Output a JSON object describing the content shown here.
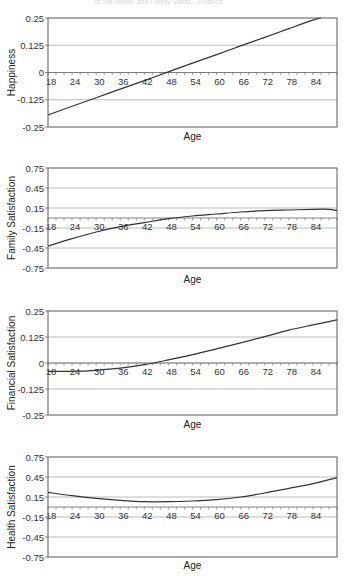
{
  "page": {
    "background": "#ffffff",
    "line_color": "#333333",
    "grid_color": "#aaaaaa",
    "border_color": "#666666",
    "bleed_through_text": "to the Health and Family Satisf... Finance"
  },
  "chart_data": [
    {
      "type": "line",
      "title": "",
      "xlabel": "Age",
      "ylabel": "Happiness",
      "xlim": [
        18,
        90
      ],
      "ylim": [
        -0.25,
        0.25
      ],
      "yticks": [
        0.25,
        0.125,
        0,
        -0.125,
        -0.25
      ],
      "ytick_labels": [
        "0.25",
        "0.125",
        "0",
        "-0.125",
        "-0.25"
      ],
      "xtick_labels": [
        "18",
        "24",
        "30",
        "36",
        "42",
        "48",
        "54",
        "60",
        "66",
        "72",
        "78",
        "84"
      ],
      "grid": true,
      "legend": null,
      "x": [
        18,
        24,
        30,
        36,
        42,
        48,
        54,
        60,
        66,
        72,
        78,
        84,
        86
      ],
      "values": [
        -0.195,
        -0.155,
        -0.116,
        -0.076,
        -0.037,
        0.003,
        0.043,
        0.082,
        0.122,
        0.161,
        0.201,
        0.24,
        0.25
      ]
    },
    {
      "type": "line",
      "title": "",
      "xlabel": "Age",
      "ylabel": "Family Satisfaction",
      "xlim": [
        18,
        90
      ],
      "ylim": [
        -0.75,
        0.75
      ],
      "yticks": [
        0.75,
        0.45,
        0.15,
        -0.15,
        -0.45,
        -0.75
      ],
      "ytick_labels": [
        "0.75",
        "0.45",
        "0.15",
        "-0.15",
        "-0.45",
        "-0.75"
      ],
      "xtick_labels": [
        "18",
        "24",
        "30",
        "36",
        "42",
        "48",
        "54",
        "60",
        "66",
        "72",
        "78",
        "84"
      ],
      "grid": true,
      "legend": null,
      "x": [
        18,
        24,
        30,
        36,
        42,
        48,
        54,
        60,
        66,
        72,
        78,
        84,
        88,
        90
      ],
      "values": [
        -0.42,
        -0.31,
        -0.21,
        -0.13,
        -0.07,
        -0.01,
        0.03,
        0.06,
        0.09,
        0.11,
        0.12,
        0.13,
        0.13,
        0.11
      ]
    },
    {
      "type": "line",
      "title": "",
      "xlabel": "Age",
      "ylabel": "Financial Satisfaction",
      "xlim": [
        18,
        90
      ],
      "ylim": [
        -0.25,
        0.25
      ],
      "yticks": [
        0.25,
        0.125,
        0,
        -0.125,
        -0.25
      ],
      "ytick_labels": [
        "0.25",
        "0.125",
        "0",
        "-0.125",
        "-0.25"
      ],
      "xtick_labels": [
        "18",
        "24",
        "30",
        "36",
        "42",
        "48",
        "54",
        "60",
        "66",
        "72",
        "78",
        "84"
      ],
      "grid": true,
      "legend": null,
      "x": [
        18,
        24,
        30,
        36,
        42,
        48,
        54,
        60,
        66,
        72,
        78,
        84,
        90
      ],
      "values": [
        -0.04,
        -0.04,
        -0.035,
        -0.025,
        -0.008,
        0.015,
        0.04,
        0.068,
        0.097,
        0.127,
        0.158,
        0.183,
        0.207
      ]
    },
    {
      "type": "line",
      "title": "",
      "xlabel": "Age",
      "ylabel": "Health Satisfaction",
      "xlim": [
        18,
        90
      ],
      "ylim": [
        -0.75,
        0.75
      ],
      "yticks": [
        0.75,
        0.45,
        0.15,
        -0.15,
        -0.45,
        -0.75
      ],
      "ytick_labels": [
        "0.75",
        "0.45",
        "0.15",
        "-0.15",
        "-0.45",
        "-0.75"
      ],
      "xtick_labels": [
        "18",
        "24",
        "30",
        "36",
        "42",
        "48",
        "54",
        "60",
        "66",
        "72",
        "78",
        "84"
      ],
      "grid": true,
      "legend": null,
      "x": [
        18,
        24,
        30,
        36,
        42,
        48,
        54,
        60,
        66,
        72,
        78,
        84,
        90
      ],
      "values": [
        0.22,
        0.17,
        0.13,
        0.1,
        0.08,
        0.08,
        0.09,
        0.11,
        0.15,
        0.21,
        0.28,
        0.35,
        0.44
      ]
    }
  ]
}
